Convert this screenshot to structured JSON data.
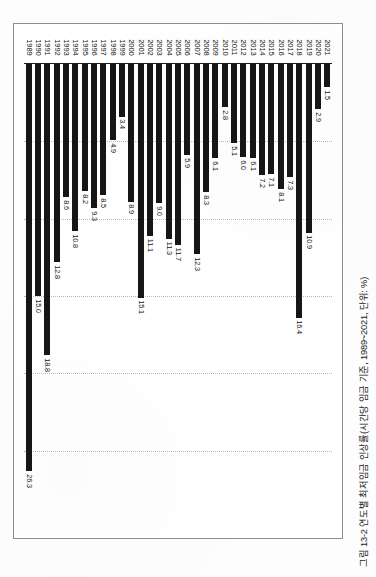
{
  "figure": {
    "caption": "그림 13-2  연도별 최저임금 인상률(시간당 임금 기준, 1989~2021, 단위: %)"
  },
  "chart_data": {
    "type": "bar",
    "title": "그림 13-2  연도별 최저임금 인상률(시간당 임금 기준, 1989~2021, 단위: %)",
    "orientation": "horizontal",
    "xlabel": "",
    "ylabel": "",
    "xlim": [
      0,
      30
    ],
    "grid": true,
    "gridlines": [
      5,
      10,
      15,
      20,
      25
    ],
    "legend": "none",
    "categories": [
      "1989",
      "1990",
      "1991",
      "1992",
      "1993",
      "1994",
      "1995",
      "1996",
      "1997",
      "1998",
      "1999",
      "2000",
      "2001",
      "2002",
      "2003",
      "2004",
      "2005",
      "2006",
      "2007",
      "2008",
      "2009",
      "2010",
      "2011",
      "2012",
      "2013",
      "2014",
      "2015",
      "2016",
      "2017",
      "2018",
      "2019",
      "2020",
      "2021"
    ],
    "values": [
      26.3,
      15.0,
      18.8,
      12.8,
      8.6,
      10.8,
      8.2,
      9.3,
      8.5,
      4.9,
      3.4,
      8.9,
      15.1,
      11.1,
      9.0,
      11.3,
      11.7,
      5.9,
      12.3,
      8.3,
      6.1,
      2.8,
      5.1,
      6.0,
      6.1,
      7.2,
      7.1,
      8.1,
      7.3,
      16.4,
      10.9,
      2.9,
      1.5
    ],
    "value_labels": [
      "26.3",
      "15.0",
      "18.8",
      "12.8",
      "8.6",
      "10.8",
      "8.2",
      "9.3",
      "8.5",
      "4.9",
      "3.4",
      "8.9",
      "15.1",
      "11.1",
      "9.0",
      "11.3",
      "11.7",
      "5.9",
      "12.3",
      "8.3",
      "6.1",
      "2.8",
      "5.1",
      "6.0",
      "6.1",
      "7.2",
      "7.1",
      "8.1",
      "7.3",
      "16.4",
      "10.9",
      "2.9",
      "1.5"
    ],
    "bar_color": "#161616",
    "grid_color": "#b9b9b9",
    "frame_color": "#8e8e8e"
  }
}
